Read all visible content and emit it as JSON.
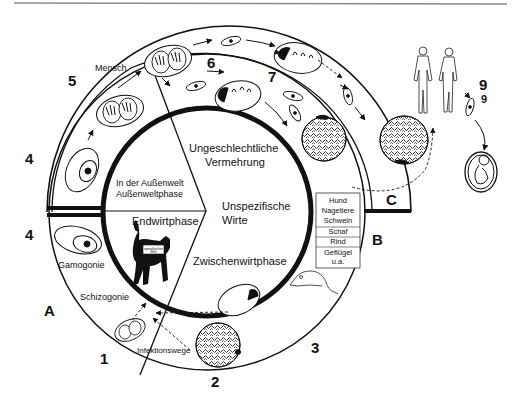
{
  "diagram": {
    "stage_numbers": {
      "n1": "1",
      "n2": "2",
      "n3": "3",
      "n4a": "4",
      "n4b": "4",
      "n5": "5",
      "n6": "6",
      "n7": "7",
      "n9a": "9",
      "n9b": "9"
    },
    "section_letters": {
      "a": "A",
      "b": "B",
      "c": "C"
    },
    "ring_labels": {
      "mensch": "Mensch",
      "gamogonie": "Gamogonie",
      "schizogonie": "Schizogonie",
      "infektionswege": "Infektionswege"
    },
    "inner_labels": {
      "aussenwelt_line1": "In der Außenwelt",
      "aussenwelt_line2": "Außenweltphase",
      "endwirtphase": "Endwirtphase",
      "ungeschlechtliche_line1": "Ungeschlechtliche",
      "ungeschlechtliche_line2": "Vermehrung",
      "unspezifische_line1": "Unspezifische",
      "unspezifische_line2": "Wirte",
      "zwischenwirtphase": "Zwischenwirtphase",
      "cat_tag_line1": "spezifischer",
      "cat_tag_line2": "Wirt"
    },
    "hosts_table": {
      "rows": [
        "Hund",
        "Nagetiere",
        "Schwein",
        "Schaf",
        "Rind",
        "Geflügel",
        "u.a."
      ]
    },
    "colors": {
      "ink": "#111111",
      "background": "#ffffff",
      "rule": "#8a8a8a"
    }
  }
}
